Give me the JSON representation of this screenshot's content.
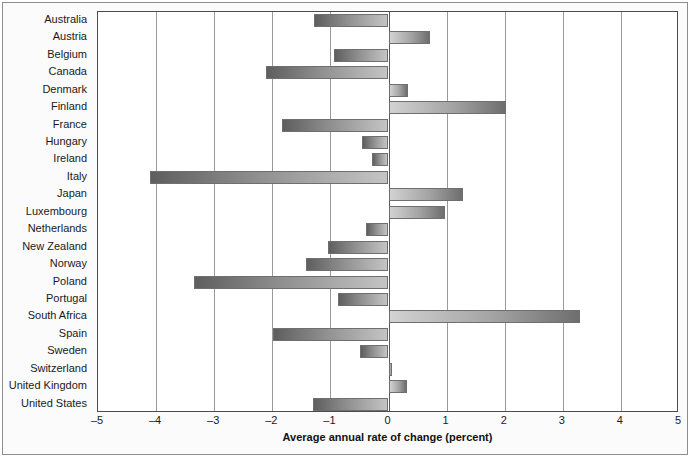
{
  "chart_data": {
    "type": "bar",
    "orientation": "horizontal",
    "title": "",
    "xlabel": "Average annual rate of change (percent)",
    "ylabel": "",
    "xlim": [
      -5,
      5
    ],
    "xticks": [
      -5,
      -4,
      -3,
      -2,
      -1,
      0,
      1,
      2,
      3,
      4,
      5
    ],
    "xticklabels": [
      "–5",
      "–4",
      "–3",
      "–2",
      "–1",
      "0",
      "1",
      "2",
      "3",
      "4",
      "5"
    ],
    "grid": true,
    "legend": false,
    "categories": [
      "Australia",
      "Austria",
      "Belgium",
      "Canada",
      "Denmark",
      "Finland",
      "France",
      "Hungary",
      "Ireland",
      "Italy",
      "Japan",
      "Luxembourg",
      "Netherlands",
      "New Zealand",
      "Norway",
      "Poland",
      "Portugal",
      "South Africa",
      "Spain",
      "Sweden",
      "Switzerland",
      "United Kingdom",
      "United States"
    ],
    "values": [
      -1.28,
      0.71,
      -0.94,
      -2.11,
      0.33,
      2.03,
      -1.83,
      -0.45,
      -0.29,
      -4.11,
      1.28,
      0.98,
      -0.39,
      -1.04,
      -1.42,
      -3.34,
      -0.87,
      3.29,
      -1.99,
      -0.49,
      0.06,
      0.32,
      -1.3
    ],
    "colors": {
      "bar_negative_start": "#5e5e5e",
      "bar_negative_end": "#c4c4c4",
      "bar_positive_start": "#d2d2d2",
      "bar_positive_end": "#6e6e6e",
      "bar_outline": "#6f6f6f",
      "gridline": "#9a9a9a",
      "zero_line": "#5a5a5a",
      "frame": "#4c4c4c",
      "outer_frame": "#8d8d8d",
      "background": "#ffffff",
      "text": "#1a1a1a"
    }
  }
}
